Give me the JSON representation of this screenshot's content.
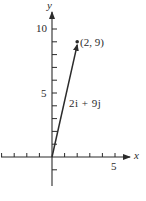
{
  "chart_data": {
    "type": "vector-diagram",
    "title": "",
    "xlabel": "x",
    "ylabel": "y",
    "xlim": [
      -4,
      6
    ],
    "ylim": [
      -3,
      11
    ],
    "x_ticks": [
      -4,
      -3,
      -2,
      -1,
      1,
      2,
      3,
      4,
      5
    ],
    "y_ticks": [
      -1,
      1,
      2,
      3,
      4,
      5,
      6,
      7,
      8,
      9,
      10
    ],
    "x_tick_labels": [
      {
        "value": 5,
        "label": "5"
      }
    ],
    "y_tick_labels": [
      {
        "value": 5,
        "label": "5"
      },
      {
        "value": 10,
        "label": "10"
      }
    ],
    "vectors": [
      {
        "from": [
          0,
          0
        ],
        "to": [
          2,
          9
        ],
        "label": "2i + 9j"
      }
    ],
    "points": [
      {
        "x": 2,
        "y": 9,
        "label": "(2, 9)"
      }
    ],
    "grid": false
  },
  "labels": {
    "x_axis": "x",
    "y_axis": "y",
    "tick_5_x": "5",
    "tick_5_y": "5",
    "tick_10_y": "10",
    "point": "(2, 9)",
    "vector": "2i + 9j"
  },
  "colors": {
    "ink": "#2b2b2b",
    "background": "#ffffff"
  }
}
